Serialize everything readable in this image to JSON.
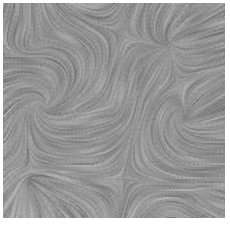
{
  "figure": {
    "kind": "line-integral-convolution",
    "canvas": {
      "width": 230,
      "height": 227
    },
    "plot_area": {
      "x": 3,
      "y": 3,
      "width": 222,
      "height": 215
    },
    "background_color": "#ffffff",
    "colormap": "grayscale",
    "gray_min": "#4a4a4a",
    "gray_max": "#dcdcdc",
    "gray_mean": "#9a9a9a",
    "noise_cell_px": 2,
    "streamline_steps": 14,
    "step_length_px": 1.15,
    "angle_quantization_deg": 15,
    "contrast": 1.35,
    "seed": 20240617
  },
  "chart_data": {
    "type": "heatmap",
    "xlabel": "",
    "ylabel": "",
    "xlim": [
      0,
      222
    ],
    "ylim": [
      0,
      215
    ],
    "grid": false,
    "legend": null,
    "vector_field": {
      "description": "Superposition of radial/vortex basis functions over a weak uniform drift.",
      "uniform_drift": {
        "u": 0.34,
        "v": -0.1
      },
      "singularities": [
        {
          "name": "focus-left",
          "x": 0.175,
          "y": 0.475,
          "strength": 1.0,
          "type": "spiral-sink",
          "swirl": 0.85,
          "radius": 0.22
        },
        {
          "name": "saddle-upper-left",
          "x": 0.16,
          "y": 0.175,
          "strength": 0.62,
          "type": "saddle",
          "swirl": -0.3,
          "radius": 0.3
        },
        {
          "name": "node-upper-right",
          "x": 0.76,
          "y": 0.18,
          "strength": 0.7,
          "type": "source",
          "swirl": 0.22,
          "radius": 0.34
        },
        {
          "name": "focus-right",
          "x": 0.82,
          "y": 0.54,
          "strength": 0.95,
          "type": "spiral-source",
          "swirl": -0.7,
          "radius": 0.24
        },
        {
          "name": "saddle-center",
          "x": 0.48,
          "y": 0.47,
          "strength": 0.55,
          "type": "saddle",
          "swirl": 0.1,
          "radius": 0.28
        },
        {
          "name": "node-lower-left",
          "x": 0.12,
          "y": 0.83,
          "strength": 0.6,
          "type": "sink",
          "swirl": 0.4,
          "radius": 0.26
        },
        {
          "name": "saddle-lower-mid",
          "x": 0.54,
          "y": 0.82,
          "strength": 0.5,
          "type": "saddle",
          "swirl": -0.18,
          "radius": 0.26
        },
        {
          "name": "node-lower-right",
          "x": 0.88,
          "y": 0.88,
          "strength": 0.45,
          "type": "source",
          "swirl": 0.3,
          "radius": 0.22
        }
      ],
      "dominant_directions": [
        {
          "region": "left-edge",
          "orientation_deg": 90,
          "label": "vertical streaks"
        },
        {
          "region": "upper-middle",
          "orientation_deg": 0,
          "label": "horizontal streaks"
        },
        {
          "region": "upper-right",
          "orientation_deg": 20,
          "label": "shallow diagonal"
        },
        {
          "region": "right-middle",
          "orientation_deg": 0,
          "label": "horizontal streaks"
        },
        {
          "region": "center",
          "orientation_deg": 75,
          "label": "near-vertical"
        },
        {
          "region": "lower-left",
          "orientation_deg": 90,
          "label": "vertical streaks"
        },
        {
          "region": "lower-middle",
          "orientation_deg": 45,
          "label": "diagonal streaks"
        },
        {
          "region": "bottom-edge",
          "orientation_deg": 30,
          "label": "shallow diagonal"
        }
      ],
      "intensity_bands": [
        {
          "region": "upper-right",
          "mean_gray": 0.46
        },
        {
          "region": "right-middle",
          "mean_gray": 0.44
        },
        {
          "region": "focus-left",
          "mean_gray": 0.4
        },
        {
          "region": "lower-left",
          "mean_gray": 0.62
        },
        {
          "region": "center",
          "mean_gray": 0.58
        }
      ]
    }
  }
}
